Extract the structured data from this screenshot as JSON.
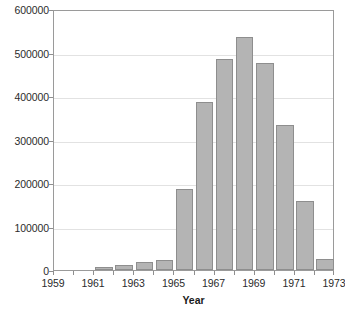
{
  "chart_data": {
    "type": "bar",
    "title": "",
    "subtitle": "",
    "xlabel": "Year",
    "ylabel": "",
    "categories": [
      1959,
      1960,
      1961,
      1962,
      1963,
      1964,
      1965,
      1966,
      1967,
      1968,
      1969,
      1970,
      1971,
      1972
    ],
    "values": [
      0,
      0,
      7000,
      12000,
      18000,
      24000,
      187000,
      386000,
      486000,
      536000,
      476000,
      334000,
      158000,
      25000
    ],
    "series": [
      {
        "name": "Count",
        "values": [
          0,
          0,
          7000,
          12000,
          18000,
          24000,
          187000,
          386000,
          486000,
          536000,
          476000,
          334000,
          158000,
          25000
        ]
      }
    ],
    "xlim": [
      1959,
      1973
    ],
    "ylim": [
      0,
      600000
    ],
    "x_tick_labels": [
      "1959",
      "1961",
      "1963",
      "1965",
      "1967",
      "1969",
      "1971",
      "1973"
    ],
    "x_tick_values": [
      1959,
      1961,
      1963,
      1965,
      1967,
      1969,
      1971,
      1973
    ],
    "y_tick_labels": [
      "0",
      "100000",
      "200000",
      "300000",
      "400000",
      "500000",
      "600000"
    ],
    "y_tick_values": [
      0,
      100000,
      200000,
      300000,
      400000,
      500000,
      600000
    ],
    "grid": "horizontal",
    "legend": "none",
    "bar_color": "#b4b4b4",
    "bar_border_color": "#8e8e8e",
    "gridline_color": "#e2e2e2",
    "axis_color": "#9a9a9a",
    "text_color": "#2b2b2b",
    "background": "#ffffff"
  }
}
